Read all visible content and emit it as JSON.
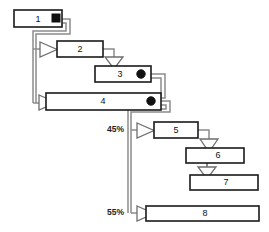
{
  "diagram": {
    "type": "flowchart",
    "colors": {
      "node_stroke": "#1a1a1a",
      "node_fill": "#ffffff",
      "connector": "#8c8c8c",
      "connector_dark": "#3a3a3a",
      "arrow_fill": "#ffffff",
      "arrow_stroke": "#6e6e6e",
      "marker_fill": "#111111",
      "label_text": "#111111",
      "background": "#ffffff"
    },
    "nodes": [
      {
        "id": "n1",
        "label": "1",
        "x": 14,
        "y": 10,
        "width": 48,
        "height": 17
      },
      {
        "id": "n2",
        "label": "2",
        "x": 57,
        "y": 41,
        "width": 46,
        "height": 16
      },
      {
        "id": "n3",
        "label": "3",
        "x": 95,
        "y": 66,
        "width": 56,
        "height": 16
      },
      {
        "id": "n4",
        "label": "4",
        "x": 46,
        "y": 93,
        "width": 115,
        "height": 17
      },
      {
        "id": "n5",
        "label": "5",
        "x": 154,
        "y": 122,
        "width": 44,
        "height": 16
      },
      {
        "id": "n6",
        "label": "6",
        "x": 186,
        "y": 148,
        "width": 58,
        "height": 15
      },
      {
        "id": "n7",
        "label": "7",
        "x": 190,
        "y": 175,
        "width": 68,
        "height": 15
      },
      {
        "id": "n8",
        "label": "8",
        "x": 146,
        "y": 206,
        "width": 113,
        "height": 15
      }
    ],
    "markers": [
      {
        "id": "m1",
        "shape": "square",
        "name": "source-marker-node-1",
        "x": 55,
        "y": 14,
        "size": 7
      },
      {
        "id": "m3",
        "shape": "circle",
        "name": "junction-marker-node-3",
        "x": 141,
        "y": 74,
        "r": 4
      },
      {
        "id": "m4",
        "shape": "circle",
        "name": "junction-marker-node-4",
        "x": 151,
        "y": 101,
        "r": 4
      }
    ],
    "edge_labels": [
      {
        "id": "pct45",
        "text": "45%",
        "x": 126,
        "y": 130
      },
      {
        "id": "pct55",
        "text": "55%",
        "x": 126,
        "y": 213
      }
    ],
    "edges": [
      {
        "id": "e1-2",
        "from": "n1",
        "to": "n2",
        "arrow": "right",
        "label": ""
      },
      {
        "id": "e1-4",
        "from": "n1",
        "to": "n4",
        "arrow": "right",
        "label": ""
      },
      {
        "id": "e2-3",
        "from": "n2",
        "to": "n3",
        "arrow": "down",
        "label": ""
      },
      {
        "id": "e3-4",
        "from": "n3",
        "to": "n4",
        "arrow": "none",
        "label": ""
      },
      {
        "id": "e4-5",
        "from": "n4",
        "to": "n5",
        "arrow": "right",
        "label": "45%"
      },
      {
        "id": "e5-6",
        "from": "n5",
        "to": "n6",
        "arrow": "down",
        "label": ""
      },
      {
        "id": "e6-7",
        "from": "n6",
        "to": "n7",
        "arrow": "down",
        "label": ""
      },
      {
        "id": "e4-8",
        "from": "n4",
        "to": "n8",
        "arrow": "right",
        "label": "55%"
      }
    ]
  }
}
